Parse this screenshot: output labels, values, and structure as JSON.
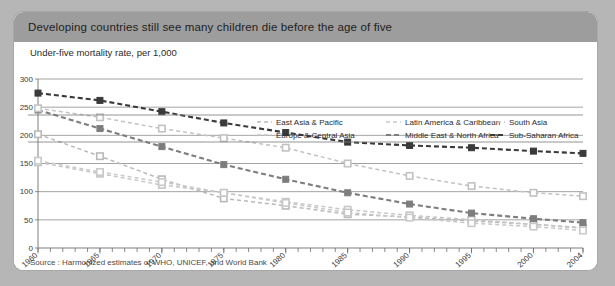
{
  "card": {
    "title": "Developing countries still see many children die before the age of five",
    "source": "Source : Harmonized estimates of WHO, UNICEF, and World Bank"
  },
  "chart_data": {
    "type": "line",
    "title": "Developing countries still see many children die before the age of five",
    "subtitle": "Under-five mortality rate, per 1,000",
    "xlabel": "",
    "ylabel": "Under-five mortality rate, per 1,000",
    "xlim": [
      1960,
      2004
    ],
    "ylim": [
      0,
      300
    ],
    "yticks": [
      0,
      50,
      100,
      150,
      200,
      250,
      300
    ],
    "xticks": [
      1960,
      1965,
      1970,
      1975,
      1980,
      1985,
      1990,
      1995,
      2000,
      2004
    ],
    "xtick_labels": [
      "1960",
      "1965",
      "1970",
      "1975",
      "1980",
      "1985",
      "1990",
      "1995",
      "2000",
      "2004"
    ],
    "grid": "horizontal",
    "legend_position": "top-right",
    "marker_x": [
      1960,
      1965,
      1970,
      1975,
      1980,
      1985,
      1990,
      1995,
      2000,
      2004
    ],
    "series": [
      {
        "name": "East Asia & Pacific",
        "color": "#b9b9b9",
        "marker": "square-open",
        "x": [
          1960,
          1965,
          1970,
          1975,
          1980,
          1985,
          1990,
          1995,
          2000,
          2004
        ],
        "values": [
          202,
          163,
          122,
          88,
          75,
          60,
          55,
          48,
          42,
          36
        ]
      },
      {
        "name": "Europe & Central Asia",
        "color": "#c6c6c6",
        "marker": "square-open",
        "x": [
          1960,
          1965,
          1970,
          1975,
          1980,
          1985,
          1990,
          1995,
          2000,
          2004
        ],
        "values": [
          152,
          132,
          112,
          98,
          82,
          68,
          58,
          50,
          42,
          35
        ]
      },
      {
        "name": "Latin America & Caribbean",
        "color": "#c9c9c9",
        "marker": "square-open",
        "x": [
          1960,
          1965,
          1970,
          1975,
          1980,
          1985,
          1990,
          1995,
          2000,
          2004
        ],
        "values": [
          155,
          135,
          117,
          98,
          80,
          63,
          54,
          44,
          38,
          31
        ]
      },
      {
        "name": "Middle East & North Africa",
        "color": "#7d7d7d",
        "marker": "square-filled",
        "x": [
          1960,
          1965,
          1970,
          1975,
          1980,
          1985,
          1990,
          1995,
          2000,
          2004
        ],
        "values": [
          245,
          212,
          180,
          148,
          122,
          98,
          78,
          62,
          52,
          45
        ]
      },
      {
        "name": "South Asia",
        "color": "#c2c2c2",
        "marker": "square-open",
        "x": [
          1960,
          1965,
          1970,
          1975,
          1980,
          1985,
          1990,
          1995,
          2000,
          2004
        ],
        "values": [
          248,
          232,
          212,
          195,
          178,
          150,
          128,
          110,
          98,
          92
        ]
      },
      {
        "name": "Sub-Saharan Africa",
        "color": "#3a3a3a",
        "marker": "square-filled",
        "x": [
          1960,
          1965,
          1970,
          1975,
          1980,
          1985,
          1990,
          1995,
          2000,
          2004
        ],
        "values": [
          275,
          262,
          242,
          222,
          205,
          188,
          182,
          178,
          172,
          168
        ]
      }
    ]
  }
}
